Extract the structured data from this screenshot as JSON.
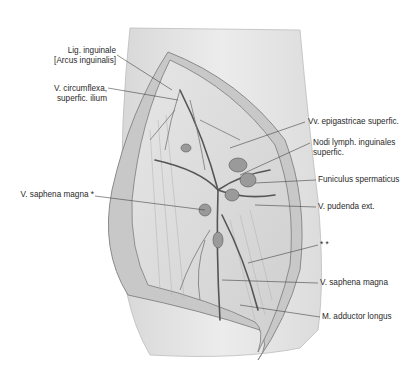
{
  "figure": {
    "type": "anatomical-illustration",
    "labels_left": [
      {
        "id": "lig-inguinale",
        "lines": [
          "Lig. inguinale",
          "[Arcus inguinalis]"
        ]
      },
      {
        "id": "v-circumflexa",
        "lines": [
          "V. circumflexa,",
          "superfic. ilium"
        ]
      },
      {
        "id": "v-saphena-magna-star",
        "lines": [
          "V. saphena magna *"
        ]
      }
    ],
    "labels_right": [
      {
        "id": "vv-epigastricae",
        "lines": [
          "Vv. epigastricae superfic."
        ]
      },
      {
        "id": "nodi-lymph",
        "lines": [
          "Nodi lymph. inguinales",
          "superfic."
        ]
      },
      {
        "id": "funiculus",
        "lines": [
          "Funiculus spermaticus"
        ]
      },
      {
        "id": "v-pudenda",
        "lines": [
          "V. pudenda ext."
        ]
      },
      {
        "id": "double-star",
        "lines": [
          "* *"
        ]
      },
      {
        "id": "v-saphena-magna",
        "lines": [
          "V. saphena magna"
        ]
      },
      {
        "id": "m-adductor",
        "lines": [
          "M. adductor longus"
        ]
      }
    ]
  }
}
